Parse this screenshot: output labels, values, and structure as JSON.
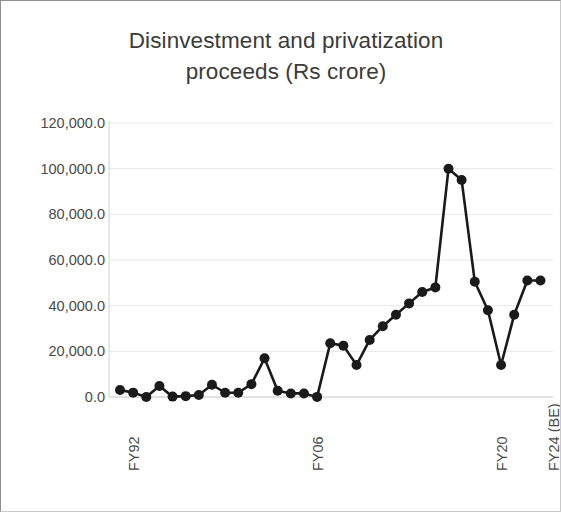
{
  "chart_data": {
    "type": "line",
    "title_line1": "Disinvestment and privatization",
    "title_line2": "proceeds (Rs crore)",
    "xlabel": "",
    "ylabel": "",
    "ylim": [
      0,
      120000
    ],
    "grid": true,
    "legend": "none",
    "marker": "filled-circle",
    "series_color": "#1a1a1a",
    "grid_color": "#e8e8e8",
    "y_ticks": [
      0,
      20000,
      40000,
      60000,
      80000,
      100000,
      120000
    ],
    "y_tick_labels": [
      "0.0",
      "20,000.0",
      "40,000.0",
      "60,000.0",
      "80,000.0",
      "100,000.0",
      "120,000.0"
    ],
    "x_tick_labels": [
      "FY92",
      "FY06",
      "FY20",
      "FY24 (BE)"
    ],
    "x_tick_indices": [
      0,
      14,
      28,
      32
    ],
    "categories": [
      "FY92",
      "FY93",
      "FY94",
      "FY95",
      "FY96",
      "FY97",
      "FY98",
      "FY99",
      "FY00",
      "FY01",
      "FY02",
      "FY03",
      "FY04",
      "FY05",
      "FY06",
      "FY07",
      "FY08",
      "FY09",
      "FY10",
      "FY11",
      "FY12",
      "FY13",
      "FY14",
      "FY15",
      "FY16",
      "FY17",
      "FY18",
      "FY19",
      "FY20",
      "FY21",
      "FY22",
      "FY23",
      "FY24 (BE)"
    ],
    "values": [
      3038,
      1913,
      0,
      4843,
      168,
      380,
      910,
      5371,
      1860,
      1871,
      5632,
      16953,
      2765,
      1570,
      1568,
      38,
      23553,
      22500,
      14000,
      25000,
      31000,
      36000,
      41000,
      46000,
      48000,
      100000,
      95000,
      50500,
      38000,
      14000,
      36000,
      51000,
      51000
    ],
    "series": [
      {
        "name": "Disinvestment and privatization proceeds (Rs crore)",
        "values": [
          3038,
          1913,
          0,
          4843,
          168,
          380,
          910,
          5371,
          1860,
          1871,
          5632,
          16953,
          2765,
          1570,
          1568,
          38,
          23553,
          22500,
          14000,
          25000,
          31000,
          36000,
          41000,
          46000,
          48000,
          100000,
          95000,
          50500,
          38000,
          14000,
          36000,
          51000,
          51000
        ]
      }
    ]
  }
}
